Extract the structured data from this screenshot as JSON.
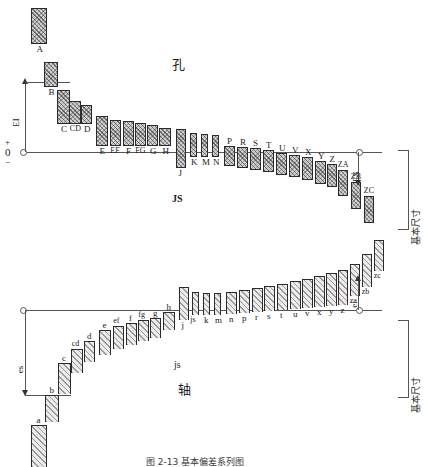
{
  "figure": {
    "caption": "图 2-13   基本偏差系列图",
    "hole_section_label": "孔",
    "shaft_section_label": "轴",
    "js_hole_label": "JS",
    "js_shaft_label": "js",
    "basic_size_label_upper": "基本尺寸",
    "basic_size_label_lower": "基本尺寸",
    "ei_label": "EI",
    "es_label": "ES",
    "shaft_es_label": "es",
    "shaft_ei_label": "ei",
    "axis_plus": "+",
    "axis_zero": "0",
    "axis_minus": "−"
  },
  "chart_data": {
    "type": "bar",
    "title": "图 2-13   基本偏差系列图",
    "xlabel": "基本尺寸",
    "ylabel": "偏差",
    "legend": [
      "孔 (hole, A–ZC)",
      "轴 (shaft, a–zc)"
    ],
    "zero_line": 0,
    "hole_zones": {
      "name": "孔 Hole basic deviations (EI above zero, ES below zero)",
      "categories": [
        "A",
        "B",
        "C",
        "CD",
        "D",
        "E",
        "EF",
        "F",
        "FG",
        "G",
        "H",
        "J",
        "K",
        "M",
        "N",
        "P",
        "R",
        "S",
        "T",
        "U",
        "V",
        "X",
        "Y",
        "Z",
        "ZA",
        "ZB",
        "ZC"
      ],
      "deviation_side": [
        "+",
        "+",
        "+",
        "+",
        "+",
        "+",
        "+",
        "+",
        "+",
        "+",
        "+",
        "±",
        "-",
        "-",
        "-",
        "-",
        "-",
        "-",
        "-",
        "-",
        "-",
        "-",
        "-",
        "-",
        "-",
        "-",
        "-"
      ]
    },
    "shaft_zones": {
      "name": "轴 Shaft basic deviations (es below zero, ei above zero)",
      "categories": [
        "a",
        "b",
        "c",
        "cd",
        "d",
        "e",
        "ef",
        "f",
        "fg",
        "g",
        "h",
        "j",
        "js",
        "k",
        "m",
        "n",
        "p",
        "r",
        "s",
        "t",
        "u",
        "v",
        "x",
        "y",
        "z",
        "za",
        "zb",
        "zc"
      ],
      "deviation_side": [
        "-",
        "-",
        "-",
        "-",
        "-",
        "-",
        "-",
        "-",
        "-",
        "-",
        "-",
        "±",
        "±",
        "+",
        "+",
        "+",
        "+",
        "+",
        "+",
        "+",
        "+",
        "+",
        "+",
        "+",
        "+",
        "+",
        "+",
        "+"
      ]
    }
  },
  "hole": {
    "above": [
      {
        "label": "A",
        "x": 31,
        "w": 16,
        "top": 8,
        "h": 36
      },
      {
        "label": "B",
        "x": 44,
        "w": 14,
        "top": 62,
        "h": 25
      },
      {
        "label": "C",
        "x": 57,
        "w": 13,
        "top": 90,
        "h": 34
      },
      {
        "label": "CD",
        "x": 69,
        "w": 12,
        "top": 101,
        "h": 23
      },
      {
        "label": "D",
        "x": 81,
        "w": 11,
        "top": 105,
        "h": 19
      },
      {
        "label": "E",
        "x": 96,
        "w": 12,
        "top": 116,
        "h": 30
      },
      {
        "label": "EF",
        "x": 110,
        "w": 11,
        "top": 120,
        "h": 26
      },
      {
        "label": "F",
        "x": 123,
        "w": 11,
        "top": 121,
        "h": 25
      },
      {
        "label": "FG",
        "x": 135,
        "w": 11,
        "top": 123,
        "h": 23
      },
      {
        "label": "G",
        "x": 147,
        "w": 11,
        "top": 125,
        "h": 21
      },
      {
        "label": "H",
        "x": 159,
        "w": 12,
        "top": 128,
        "h": 18
      },
      {
        "label": "J",
        "x": 176,
        "w": 10,
        "top": 129,
        "h": 39
      },
      {
        "label": "K",
        "x": 190,
        "w": 7,
        "top": 133,
        "h": 24
      },
      {
        "label": "M",
        "x": 201,
        "w": 7,
        "top": 134,
        "h": 23
      },
      {
        "label": "N",
        "x": 212,
        "w": 7,
        "top": 135,
        "h": 22
      }
    ],
    "below": [
      {
        "label": "P",
        "x": 224,
        "w": 11,
        "top": 146,
        "h": 20
      },
      {
        "label": "R",
        "x": 237,
        "w": 11,
        "top": 147,
        "h": 21
      },
      {
        "label": "S",
        "x": 250,
        "w": 11,
        "top": 148,
        "h": 22
      },
      {
        "label": "T",
        "x": 263,
        "w": 11,
        "top": 150,
        "h": 22
      },
      {
        "label": "U",
        "x": 276,
        "w": 11,
        "top": 153,
        "h": 22
      },
      {
        "label": "V",
        "x": 289,
        "w": 11,
        "top": 155,
        "h": 22
      },
      {
        "label": "X",
        "x": 302,
        "w": 11,
        "top": 157,
        "h": 23
      },
      {
        "label": "Y",
        "x": 315,
        "w": 11,
        "top": 161,
        "h": 23
      },
      {
        "label": "Z",
        "x": 327,
        "w": 10,
        "top": 164,
        "h": 23
      },
      {
        "label": "ZA",
        "x": 338,
        "w": 10,
        "top": 170,
        "h": 26
      },
      {
        "label": "ZB",
        "x": 351,
        "w": 10,
        "top": 182,
        "h": 27
      },
      {
        "label": "ZC",
        "x": 364,
        "w": 10,
        "top": 196,
        "h": 27
      }
    ]
  },
  "shaft": {
    "below": [
      {
        "label": "a",
        "x": 31,
        "w": 16,
        "top": 425,
        "h": 42
      },
      {
        "label": "b",
        "x": 45,
        "w": 14,
        "top": 395,
        "h": 27
      },
      {
        "label": "c",
        "x": 58,
        "w": 13,
        "top": 363,
        "h": 31
      },
      {
        "label": "cd",
        "x": 71,
        "w": 12,
        "top": 349,
        "h": 24
      },
      {
        "label": "d",
        "x": 84,
        "w": 11,
        "top": 341,
        "h": 21
      },
      {
        "label": "e",
        "x": 99,
        "w": 12,
        "top": 330,
        "h": 25
      },
      {
        "label": "ef",
        "x": 113,
        "w": 11,
        "top": 326,
        "h": 23
      },
      {
        "label": "f",
        "x": 126,
        "w": 11,
        "top": 323,
        "h": 22
      },
      {
        "label": "fg",
        "x": 138,
        "w": 11,
        "top": 320,
        "h": 21
      },
      {
        "label": "g",
        "x": 150,
        "w": 11,
        "top": 318,
        "h": 20
      },
      {
        "label": "h",
        "x": 163,
        "w": 12,
        "top": 312,
        "h": 18
      }
    ],
    "above": [
      {
        "label": "j",
        "x": 179,
        "w": 10,
        "top": 287,
        "h": 33
      },
      {
        "label": "js",
        "x": 192,
        "w": 7,
        "top": 292,
        "h": 23
      },
      {
        "label": "k",
        "x": 203,
        "w": 7,
        "top": 293,
        "h": 22
      },
      {
        "label": "m",
        "x": 214,
        "w": 7,
        "top": 293,
        "h": 22
      },
      {
        "label": "n",
        "x": 226,
        "w": 11,
        "top": 292,
        "h": 22
      },
      {
        "label": "p",
        "x": 239,
        "w": 11,
        "top": 290,
        "h": 23
      },
      {
        "label": "r",
        "x": 252,
        "w": 11,
        "top": 288,
        "h": 24
      },
      {
        "label": "s",
        "x": 264,
        "w": 11,
        "top": 286,
        "h": 25
      },
      {
        "label": "t",
        "x": 277,
        "w": 11,
        "top": 284,
        "h": 26
      },
      {
        "label": "u",
        "x": 290,
        "w": 11,
        "top": 281,
        "h": 28
      },
      {
        "label": "v",
        "x": 302,
        "w": 11,
        "top": 279,
        "h": 29
      },
      {
        "label": "x",
        "x": 314,
        "w": 11,
        "top": 276,
        "h": 31
      },
      {
        "label": "y",
        "x": 326,
        "w": 11,
        "top": 273,
        "h": 33
      },
      {
        "label": "z",
        "x": 338,
        "w": 10,
        "top": 270,
        "h": 35
      },
      {
        "label": "za",
        "x": 350,
        "w": 10,
        "top": 264,
        "h": 32
      },
      {
        "label": "zb",
        "x": 362,
        "w": 10,
        "top": 254,
        "h": 33
      },
      {
        "label": "zc",
        "x": 374,
        "w": 10,
        "top": 240,
        "h": 31
      }
    ]
  }
}
